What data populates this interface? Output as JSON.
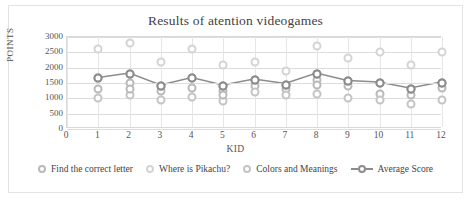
{
  "card": {
    "border_color": "#e3e3e3",
    "background": "#ffffff"
  },
  "chart_data": {
    "type": "scatter",
    "title": "Results of atention videogames",
    "xlabel": "KID",
    "ylabel": "POINTS",
    "xlim": [
      0,
      12
    ],
    "ylim": [
      0,
      3000
    ],
    "ytick_step": 500,
    "grid": true,
    "legend_position": "bottom",
    "x_ticks": [
      "0",
      "1",
      "2",
      "3",
      "4",
      "5",
      "6",
      "7",
      "8",
      "9",
      "10",
      "11",
      "12"
    ],
    "y_ticks": [
      "3000",
      "2500",
      "2000",
      "1500",
      "1000",
      "500",
      "0"
    ],
    "categories": [
      1,
      2,
      3,
      4,
      5,
      6,
      7,
      8,
      9,
      10,
      11,
      12
    ],
    "series": [
      {
        "name": "Find the correct letter",
        "color": "#b9b9b9",
        "marker": "circle-open",
        "values": [
          1300,
          1500,
          1250,
          1350,
          1250,
          1400,
          1300,
          1600,
          1400,
          1150,
          1100,
          1350
        ]
      },
      {
        "name": "Where is Pikachu?",
        "color": "#d4d4d4",
        "marker": "circle-open",
        "values": [
          2600,
          2800,
          2200,
          2600,
          2100,
          2200,
          1900,
          2700,
          2300,
          2500,
          2100,
          2500
        ]
      },
      {
        "name": "Colors and Meanings",
        "color": "#c4c4c4",
        "marker": "circle-open",
        "values": [
          1000,
          1100,
          950,
          1050,
          900,
          1200,
          1100,
          1150,
          1000,
          950,
          800,
          950
        ]
      },
      {
        "name": "Average Score",
        "color": "#8c8c8c",
        "marker": "circle-open-line",
        "values": [
          1650,
          1800,
          1400,
          1650,
          1400,
          1600,
          1450,
          1800,
          1550,
          1500,
          1300,
          1500
        ]
      }
    ],
    "extra_points": [
      {
        "series": "Find the correct letter",
        "x": 2,
        "y": 1300
      },
      {
        "series": "Find the correct letter",
        "x": 5,
        "y": 1100
      },
      {
        "series": "Find the correct letter",
        "x": 8,
        "y": 1450
      }
    ]
  }
}
